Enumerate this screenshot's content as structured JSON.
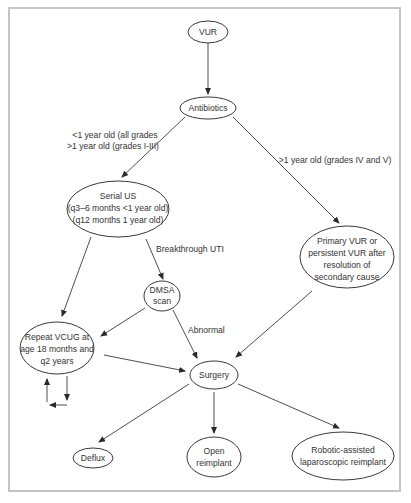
{
  "diagram": {
    "type": "flowchart",
    "colors": {
      "stroke": "#3a3a3a",
      "text": "#333333",
      "frame": "#c4c4c4",
      "background": "#ffffff"
    },
    "nodes": {
      "vur": {
        "lines": [
          "VUR"
        ]
      },
      "antibiotics": {
        "lines": [
          "Antibiotics"
        ]
      },
      "serial_us": {
        "lines": [
          "Serial US",
          "(q3–6 months <1 year old)",
          "(q12 months 1 year old)"
        ]
      },
      "primary_vur": {
        "lines": [
          "Primary VUR or",
          "persistent VUR after",
          "resolution of",
          "secondary cause"
        ]
      },
      "dmsa": {
        "lines": [
          "DMSA",
          "scan"
        ]
      },
      "repeat_vcug": {
        "lines": [
          "Repeat VCUG at",
          "age 18 months and",
          "q2 years"
        ]
      },
      "surgery": {
        "lines": [
          "Surgery"
        ]
      },
      "deflux": {
        "lines": [
          "Deflux"
        ]
      },
      "open_reimplant": {
        "lines": [
          "Open",
          "reimplant"
        ]
      },
      "robotic": {
        "lines": [
          "Robotic-assisted",
          "laparoscopic reimplant"
        ]
      }
    },
    "edge_labels": {
      "young": [
        "<1 year old (all grades",
        ">1 year old (grades I-III)"
      ],
      "older": [
        ">1 year old (grades IV and V)"
      ],
      "breakthrough": [
        "Breakthrough UTI"
      ],
      "abnormal": [
        "Abnormal"
      ]
    },
    "edges": [
      {
        "from": "VUR",
        "to": "Antibiotics"
      },
      {
        "from": "Antibiotics",
        "to": "Serial US",
        "label": "<1 year old (all grades / >1 year old (grades I-III)"
      },
      {
        "from": "Antibiotics",
        "to": "Primary VUR or persistent VUR after resolution of secondary cause",
        "label": ">1 year old (grades IV and V)"
      },
      {
        "from": "Serial US",
        "to": "Repeat VCUG at age 18 months and q2 years"
      },
      {
        "from": "Serial US",
        "to": "DMSA scan",
        "label": "Breakthrough UTI"
      },
      {
        "from": "DMSA scan",
        "to": "Repeat VCUG at age 18 months and q2 years"
      },
      {
        "from": "DMSA scan",
        "to": "Surgery",
        "label": "Abnormal"
      },
      {
        "from": "Primary VUR or persistent VUR after resolution of secondary cause",
        "to": "Surgery"
      },
      {
        "from": "Repeat VCUG at age 18 months and q2 years",
        "to": "Surgery"
      },
      {
        "from": "Repeat VCUG at age 18 months and q2 years",
        "to": "Repeat VCUG at age 18 months and q2 years",
        "label": "loop"
      },
      {
        "from": "Surgery",
        "to": "Deflux"
      },
      {
        "from": "Surgery",
        "to": "Open reimplant"
      },
      {
        "from": "Surgery",
        "to": "Robotic-assisted laparoscopic reimplant"
      }
    ]
  }
}
